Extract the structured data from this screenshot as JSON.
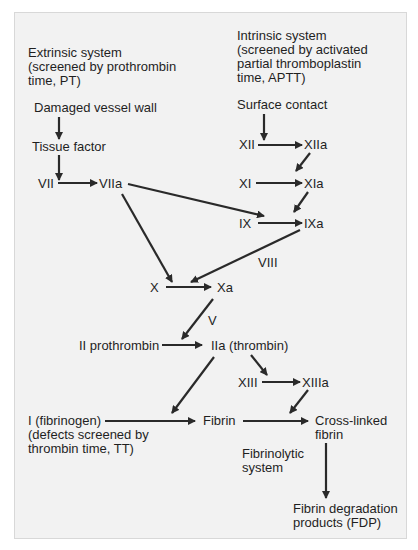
{
  "diagram": {
    "extrinsic": {
      "heading": "Extrinsic system\n(screened by prothrombin\ntime, PT)",
      "start": "Damaged vessel wall",
      "tissue_factor": "Tissue factor",
      "vii": "VII",
      "viia": "VIIa"
    },
    "intrinsic": {
      "heading": "Intrinsic system\n(screened by activated\npartial thromboplastin\ntime, APTT)",
      "start": "Surface contact",
      "xii": "XII",
      "xiia": "XIIa",
      "xi": "XI",
      "xia": "XIa",
      "ix": "IX",
      "ixa": "IXa",
      "viii": "VIII"
    },
    "common": {
      "x": "X",
      "xa": "Xa",
      "v": "V",
      "ii": "II prothrombin",
      "iia": "IIa (thrombin)",
      "xiii": "XIII",
      "xiiia": "XIIIa",
      "fibrinogen": "I (fibrinogen)\n(defects screened by\nthrombin time, TT)",
      "fibrin": "Fibrin",
      "crosslinked": "Cross-linked\nfibrin",
      "fibrinolytic": "Fibrinolytic\nsystem",
      "fdp": "Fibrin degradation\nproducts (FDP)"
    },
    "colors": {
      "background": "#f2f2f2",
      "border": "#d8d8d8",
      "arrow": "#2a2a2a",
      "text": "#1f1f1f"
    }
  }
}
